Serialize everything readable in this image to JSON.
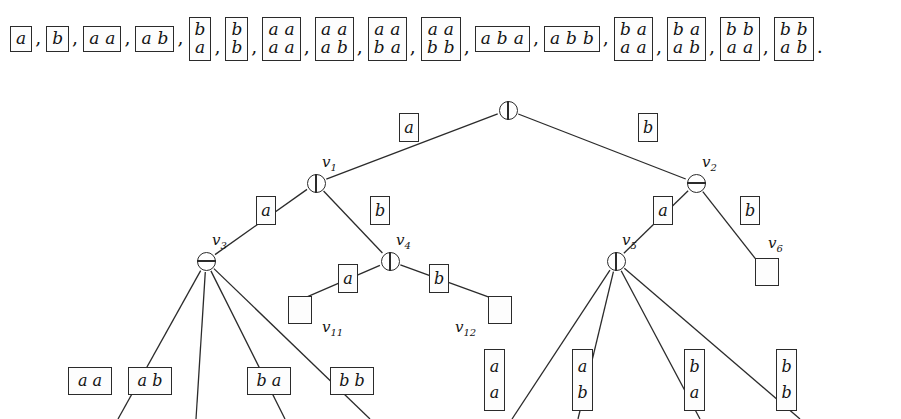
{
  "figure": {
    "type": "labeled-tree-diagram",
    "colors": {
      "ink": "#1a1a1a",
      "stroke": "#2b2b2b",
      "background": "#ffffff"
    }
  },
  "sequence": {
    "separator": ",",
    "terminator": ".",
    "items": [
      {
        "id": "s1",
        "rows": [
          [
            "a"
          ]
        ]
      },
      {
        "id": "s2",
        "rows": [
          [
            "b"
          ]
        ]
      },
      {
        "id": "s3",
        "rows": [
          [
            "a",
            "a"
          ]
        ]
      },
      {
        "id": "s4",
        "rows": [
          [
            "a",
            "b"
          ]
        ]
      },
      {
        "id": "s5",
        "rows": [
          [
            "b"
          ],
          [
            "a"
          ]
        ]
      },
      {
        "id": "s6",
        "rows": [
          [
            "b"
          ],
          [
            "b"
          ]
        ]
      },
      {
        "id": "s7",
        "rows": [
          [
            "a",
            "a"
          ],
          [
            "a",
            "a"
          ]
        ]
      },
      {
        "id": "s8",
        "rows": [
          [
            "a",
            "a"
          ],
          [
            "a",
            "b"
          ]
        ]
      },
      {
        "id": "s9",
        "rows": [
          [
            "a",
            "a"
          ],
          [
            "b",
            "a"
          ]
        ]
      },
      {
        "id": "s10",
        "rows": [
          [
            "a",
            "a"
          ],
          [
            "b",
            "b"
          ]
        ]
      },
      {
        "id": "s11",
        "rows": [
          [
            "a",
            "b",
            "a"
          ]
        ]
      },
      {
        "id": "s12",
        "rows": [
          [
            "a",
            "b",
            "b"
          ]
        ]
      },
      {
        "id": "s13",
        "rows": [
          [
            "b",
            "a"
          ],
          [
            "a",
            "a"
          ]
        ]
      },
      {
        "id": "s14",
        "rows": [
          [
            "b",
            "a"
          ],
          [
            "a",
            "b"
          ]
        ]
      },
      {
        "id": "s15",
        "rows": [
          [
            "b",
            "b"
          ],
          [
            "a",
            "a"
          ]
        ]
      },
      {
        "id": "s16",
        "rows": [
          [
            "b",
            "b"
          ],
          [
            "a",
            "b"
          ]
        ]
      }
    ]
  },
  "tree": {
    "nodes": [
      {
        "id": "root",
        "label": "",
        "glyph": "circle-vertical-bar",
        "x": 508,
        "y": 110
      },
      {
        "id": "v1",
        "label": "v1",
        "glyph": "circle-vertical-bar",
        "x": 316,
        "y": 183
      },
      {
        "id": "v2",
        "label": "v2",
        "glyph": "circle-horizontal-bar",
        "x": 696,
        "y": 183
      },
      {
        "id": "v3",
        "label": "v3",
        "glyph": "circle-horizontal-bar",
        "x": 206,
        "y": 261
      },
      {
        "id": "v4",
        "label": "v4",
        "glyph": "circle-vertical-bar",
        "x": 390,
        "y": 261
      },
      {
        "id": "v5",
        "label": "v5",
        "glyph": "circle-vertical-bar",
        "x": 616,
        "y": 261
      },
      {
        "id": "v6",
        "label": "v6",
        "glyph": "empty-box",
        "x": 762,
        "y": 264
      }
    ],
    "leaf_labels": [
      {
        "id": "v11",
        "label": "v11",
        "x": 322,
        "y": 318
      },
      {
        "id": "v12",
        "label": "v12",
        "x": 455,
        "y": 318
      }
    ],
    "edges": [
      {
        "from": "root",
        "to": "v1",
        "label": "a"
      },
      {
        "from": "root",
        "to": "v2",
        "label": "b"
      },
      {
        "from": "v1",
        "to": "v3",
        "label": "a"
      },
      {
        "from": "v1",
        "to": "v4",
        "label": "b"
      },
      {
        "from": "v2",
        "to": "v5",
        "label": "a"
      },
      {
        "from": "v2",
        "to": "v6",
        "label": "b"
      },
      {
        "from": "v4",
        "to": "v11",
        "label": "a"
      },
      {
        "from": "v4",
        "to": "v12",
        "label": "b"
      }
    ],
    "edge_label_tiles": [
      {
        "id": "el-root-a",
        "rows": [
          [
            "a"
          ]
        ],
        "x": 399,
        "y": 113
      },
      {
        "id": "el-root-b",
        "rows": [
          [
            "b"
          ]
        ],
        "x": 638,
        "y": 113
      },
      {
        "id": "el-v1-a",
        "rows": [
          [
            "a"
          ]
        ],
        "x": 256,
        "y": 196
      },
      {
        "id": "el-v1-b",
        "rows": [
          [
            "b"
          ]
        ],
        "x": 370,
        "y": 196
      },
      {
        "id": "el-v2-a",
        "rows": [
          [
            "a"
          ]
        ],
        "x": 653,
        "y": 196
      },
      {
        "id": "el-v2-b",
        "rows": [
          [
            "b"
          ]
        ],
        "x": 740,
        "y": 196
      },
      {
        "id": "el-v4-a",
        "rows": [
          [
            "a"
          ]
        ],
        "x": 338,
        "y": 264
      },
      {
        "id": "el-v4-b",
        "rows": [
          [
            "b"
          ]
        ],
        "x": 429,
        "y": 264
      }
    ],
    "empty_boxes": [
      {
        "id": "box-v11",
        "x": 288,
        "y": 296
      },
      {
        "id": "box-v12",
        "x": 488,
        "y": 296
      },
      {
        "id": "box-v6",
        "x": 755,
        "y": 258
      }
    ],
    "bottom_tiles": [
      {
        "id": "b1",
        "rows": [
          [
            "a",
            "a"
          ]
        ],
        "x": 68,
        "y": 367
      },
      {
        "id": "b2",
        "rows": [
          [
            "a",
            "b"
          ]
        ],
        "x": 128,
        "y": 367
      },
      {
        "id": "b3",
        "rows": [
          [
            "b",
            "a"
          ]
        ],
        "x": 247,
        "y": 367
      },
      {
        "id": "b4",
        "rows": [
          [
            "b",
            "b"
          ]
        ],
        "x": 330,
        "y": 367
      },
      {
        "id": "b5",
        "rows": [
          [
            "a"
          ],
          [
            "a"
          ]
        ],
        "x": 484,
        "y": 349
      },
      {
        "id": "b6",
        "rows": [
          [
            "a"
          ],
          [
            "b"
          ]
        ],
        "x": 572,
        "y": 349
      },
      {
        "id": "b7",
        "rows": [
          [
            "b"
          ],
          [
            "a"
          ]
        ],
        "x": 684,
        "y": 349
      },
      {
        "id": "b8",
        "rows": [
          [
            "b"
          ],
          [
            "b"
          ]
        ],
        "x": 776,
        "y": 349
      }
    ],
    "fan_edges_v3": [
      {
        "from": "v3",
        "to_x": 118,
        "to_y": 419
      },
      {
        "from": "v3",
        "to_x": 196,
        "to_y": 419
      },
      {
        "from": "v3",
        "to_x": 285,
        "to_y": 419
      },
      {
        "from": "v3",
        "to_x": 370,
        "to_y": 419
      }
    ],
    "fan_edges_v5": [
      {
        "from": "v5",
        "to_x": 512,
        "to_y": 419
      },
      {
        "from": "v5",
        "to_x": 578,
        "to_y": 419
      },
      {
        "from": "v5",
        "to_x": 700,
        "to_y": 419
      },
      {
        "from": "v5",
        "to_x": 800,
        "to_y": 419
      }
    ]
  }
}
